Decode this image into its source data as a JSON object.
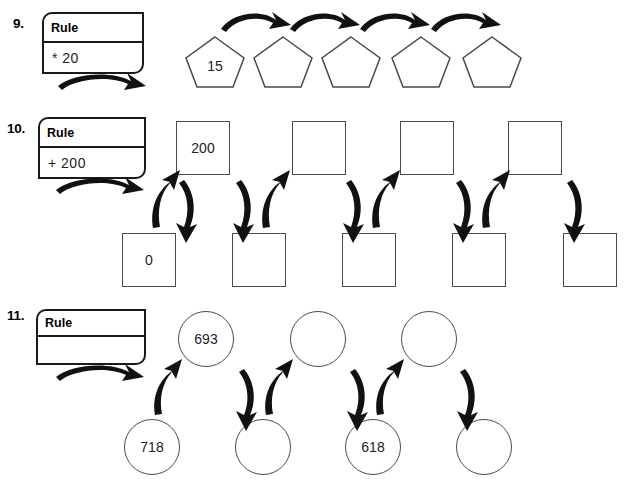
{
  "page": {
    "rule_label": "Rule"
  },
  "problems": [
    {
      "number": "9.",
      "rule": "* 20",
      "shape": "pentagon",
      "rows": [
        {
          "values": [
            "15",
            "",
            "",
            "",
            ""
          ]
        }
      ]
    },
    {
      "number": "10.",
      "rule": "+ 200",
      "shape": "square",
      "rows": [
        {
          "values": [
            "200",
            "",
            "",
            "",
            ""
          ]
        },
        {
          "values": [
            "0",
            "",
            "",
            "",
            ""
          ]
        }
      ]
    },
    {
      "number": "11.",
      "rule": "",
      "shape": "circle",
      "rows": [
        {
          "values": [
            "693",
            "",
            ""
          ]
        },
        {
          "values": [
            "718",
            "",
            "618",
            ""
          ]
        }
      ]
    }
  ]
}
